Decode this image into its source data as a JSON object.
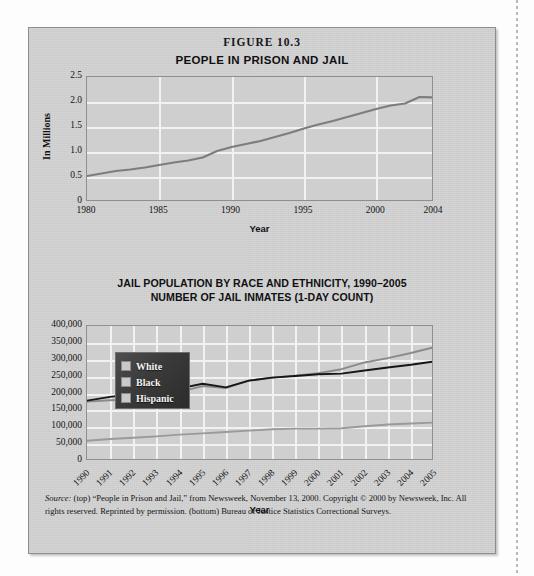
{
  "figure": {
    "number_label": "FIGURE 10.3",
    "panel_bg": "#d2d2d2",
    "plot_bg": "#cfcfcf",
    "grid_color": "#f2f2f2"
  },
  "source_note": {
    "lead": "Source:",
    "text": " (top) “People in Prison and Jail,” from Newsweek, November 13, 2000. Copyright © 2000 by Newsweek, Inc. All rights reserved. Reprinted by permission. (bottom) Bureau of Justice Statistics Correctional Surveys."
  },
  "legend": {
    "items": [
      {
        "label": "White",
        "swatch": "#c9c9c9"
      },
      {
        "label": "Black",
        "swatch": "#c9c9c9"
      },
      {
        "label": "Hispanic",
        "swatch": "#c9c9c9"
      }
    ]
  },
  "chart_data": [
    {
      "id": "people-in-prison-and-jail",
      "type": "line",
      "title": "PEOPLE IN PRISON AND JAIL",
      "xlabel": "Year",
      "ylabel": "In Millions",
      "xlim": [
        1980,
        2004
      ],
      "ylim": [
        0,
        2.5
      ],
      "ytick_labels": [
        "2.5",
        "2.0",
        "1.5",
        "1.0",
        "0.5",
        "0"
      ],
      "ytick_values": [
        2.5,
        2.0,
        1.5,
        1.0,
        0.5,
        0
      ],
      "xtick_labels": [
        "1980",
        "1985",
        "1990",
        "1995",
        "2000",
        "2004"
      ],
      "xtick_values": [
        1980,
        1985,
        1990,
        1995,
        2000,
        2004
      ],
      "grid": true,
      "legend": "none",
      "line_color": "#7d7d7d",
      "series": [
        {
          "name": "Total people in prison and jail",
          "x": [
            1980,
            1981,
            1982,
            1983,
            1984,
            1985,
            1986,
            1987,
            1988,
            1989,
            1990,
            1991,
            1992,
            1993,
            1994,
            1995,
            1996,
            1997,
            1998,
            1999,
            2000,
            2001,
            2002,
            2003,
            2004
          ],
          "values": [
            0.52,
            0.57,
            0.62,
            0.65,
            0.69,
            0.74,
            0.79,
            0.83,
            0.89,
            1.02,
            1.1,
            1.16,
            1.22,
            1.3,
            1.38,
            1.47,
            1.55,
            1.62,
            1.7,
            1.78,
            1.86,
            1.93,
            1.97,
            2.1,
            2.09
          ]
        }
      ]
    },
    {
      "id": "jail-population-by-race-and-ethnicity",
      "type": "line",
      "title_line1": "JAIL POPULATION BY RACE AND ETHNICITY, 1990–2005",
      "title_line2": "NUMBER OF JAIL INMATES (1-DAY COUNT)",
      "xlabel": "Year",
      "ylabel": "",
      "xlim": [
        1990,
        2005
      ],
      "ylim": [
        0,
        400000
      ],
      "ytick_labels": [
        "400,000",
        "350,000",
        "300,000",
        "250,000",
        "200,000",
        "150,000",
        "100,000",
        "50,000",
        "0"
      ],
      "ytick_values": [
        400000,
        350000,
        300000,
        250000,
        200000,
        150000,
        100000,
        50000,
        0
      ],
      "xtick_labels": [
        "1990",
        "1991",
        "1992",
        "1993",
        "1994",
        "1995",
        "1996",
        "1997",
        "1998",
        "1999",
        "2000",
        "2001",
        "2002",
        "2003",
        "2004",
        "2005"
      ],
      "xtick_values": [
        1990,
        1991,
        1992,
        1993,
        1994,
        1995,
        1996,
        1997,
        1998,
        1999,
        2000,
        2001,
        2002,
        2003,
        2004,
        2005
      ],
      "grid": true,
      "legend": "upper-left",
      "series": [
        {
          "name": "White",
          "color": "#8a8a8a",
          "x": [
            1990,
            1991,
            1992,
            1993,
            1994,
            1995,
            1996,
            1997,
            1998,
            1999,
            2000,
            2001,
            2002,
            2003,
            2004,
            2005
          ],
          "values": [
            176000,
            180000,
            183000,
            188000,
            205000,
            222000,
            216000,
            238000,
            247000,
            253000,
            260000,
            272000,
            292000,
            305000,
            320000,
            337000
          ]
        },
        {
          "name": "Black",
          "color": "#16161a",
          "x": [
            1990,
            1991,
            1992,
            1993,
            1994,
            1995,
            1996,
            1997,
            1998,
            1999,
            2000,
            2001,
            2002,
            2003,
            2004,
            2005
          ],
          "values": [
            179000,
            190000,
            198000,
            206000,
            215000,
            229000,
            218000,
            238000,
            247000,
            252000,
            257000,
            259000,
            268000,
            277000,
            285000,
            295000
          ]
        },
        {
          "name": "Hispanic",
          "color": "#9a9a9a",
          "x": [
            1990,
            1991,
            1992,
            1993,
            1994,
            1995,
            1996,
            1997,
            1998,
            1999,
            2000,
            2001,
            2002,
            2003,
            2004,
            2005
          ],
          "values": [
            60000,
            65000,
            69000,
            73000,
            78000,
            82000,
            86000,
            90000,
            94000,
            96000,
            96000,
            97000,
            103000,
            108000,
            111000,
            114000
          ]
        }
      ]
    }
  ]
}
